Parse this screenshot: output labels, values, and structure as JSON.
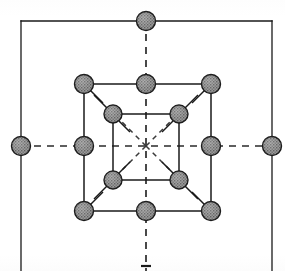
{
  "figure": {
    "width": 285,
    "height": 271,
    "background_color": "#ffffff"
  },
  "style": {
    "line_color": "#1a1a1a",
    "line_width": 1.3,
    "dash_color": "#2a2a2a",
    "dash_width": 1.6,
    "dash_pattern": "7 6",
    "node_fill": "#8f8f8f",
    "node_stroke": "#1a1a1a",
    "node_stroke_width": 1.4,
    "stipple_color": "#5e5e5e"
  },
  "geometry": {
    "center": {
      "x": 146,
      "y": 146
    },
    "outer_square": {
      "left": 21,
      "top": 21,
      "right": 272,
      "bottom": 290
    },
    "medium_square": {
      "left": 84,
      "top": 84,
      "right": 211,
      "bottom": 211
    },
    "inner_square": {
      "left": 113,
      "top": 114,
      "right": 179,
      "bottom": 180
    }
  },
  "nodes": {
    "outer": {
      "radius": 9.5,
      "label": "outer-boundary-node",
      "points": [
        {
          "id": "outer-top",
          "x": 146,
          "y": 21
        },
        {
          "id": "outer-left",
          "x": 21,
          "y": 146
        },
        {
          "id": "outer-right",
          "x": 272,
          "y": 146
        }
      ]
    },
    "medium": {
      "radius": 9.5,
      "label": "medium-square-node",
      "points": [
        {
          "id": "med-top-left",
          "x": 84,
          "y": 84
        },
        {
          "id": "med-top-mid",
          "x": 146,
          "y": 84
        },
        {
          "id": "med-top-right",
          "x": 211,
          "y": 84
        },
        {
          "id": "med-mid-left",
          "x": 84,
          "y": 146
        },
        {
          "id": "med-mid-right",
          "x": 211,
          "y": 146
        },
        {
          "id": "med-bottom-left",
          "x": 84,
          "y": 211
        },
        {
          "id": "med-bottom-mid",
          "x": 146,
          "y": 211
        },
        {
          "id": "med-bottom-right",
          "x": 211,
          "y": 211
        }
      ]
    },
    "inner": {
      "radius": 9.0,
      "label": "inner-square-node",
      "points": [
        {
          "id": "inner-top-left",
          "x": 113,
          "y": 114
        },
        {
          "id": "inner-top-right",
          "x": 179,
          "y": 114
        },
        {
          "id": "inner-bottom-left",
          "x": 113,
          "y": 180
        },
        {
          "id": "inner-bottom-right",
          "x": 179,
          "y": 180
        }
      ]
    }
  },
  "axes": {
    "horizontal": {
      "x1": 21,
      "y1": 146,
      "x2": 272,
      "y2": 146
    },
    "vertical": {
      "x1": 146,
      "y1": 21,
      "x2": 146,
      "y2": 271
    },
    "star_rays": [
      {
        "id": "star-ray-nw",
        "x1": 146,
        "y1": 146,
        "x2": 117,
        "y2": 117
      },
      {
        "id": "star-ray-ne",
        "x1": 146,
        "y1": 146,
        "x2": 175,
        "y2": 117
      },
      {
        "id": "star-ray-sw",
        "x1": 146,
        "y1": 146,
        "x2": 117,
        "y2": 175
      },
      {
        "id": "star-ray-se",
        "x1": 146,
        "y1": 146,
        "x2": 175,
        "y2": 175
      }
    ]
  },
  "diagonal_stubs": [
    {
      "id": "stub-med-tl",
      "x1": 90,
      "y1": 90,
      "x2": 103,
      "y2": 103
    },
    {
      "id": "stub-med-tr",
      "x1": 205,
      "y1": 90,
      "x2": 192,
      "y2": 103
    },
    {
      "id": "stub-med-bl",
      "x1": 90,
      "y1": 205,
      "x2": 103,
      "y2": 192
    },
    {
      "id": "stub-med-br",
      "x1": 205,
      "y1": 205,
      "x2": 192,
      "y2": 192
    },
    {
      "id": "stub-inner-tl-out",
      "x1": 107,
      "y1": 108,
      "x2": 95,
      "y2": 96
    },
    {
      "id": "stub-inner-tl-in",
      "x1": 119,
      "y1": 120,
      "x2": 129,
      "y2": 130
    },
    {
      "id": "stub-inner-tr-out",
      "x1": 185,
      "y1": 108,
      "x2": 197,
      "y2": 96
    },
    {
      "id": "stub-inner-tr-in",
      "x1": 173,
      "y1": 120,
      "x2": 163,
      "y2": 130
    },
    {
      "id": "stub-inner-bl-out",
      "x1": 107,
      "y1": 186,
      "x2": 95,
      "y2": 198
    },
    {
      "id": "stub-inner-bl-in",
      "x1": 119,
      "y1": 174,
      "x2": 129,
      "y2": 164
    },
    {
      "id": "stub-inner-br-out",
      "x1": 185,
      "y1": 186,
      "x2": 197,
      "y2": 198
    },
    {
      "id": "stub-inner-br-in",
      "x1": 173,
      "y1": 174,
      "x2": 163,
      "y2": 164
    }
  ],
  "bottom_marker": {
    "x": 146,
    "y": 266,
    "half_width": 5
  }
}
